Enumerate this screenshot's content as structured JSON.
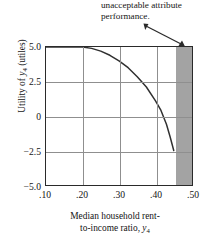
{
  "chart_data": {
    "type": "line",
    "title": "",
    "xlabel_line1": "Median household rent-",
    "xlabel_line2_pre": "to-income ratio, ",
    "xlabel_var": "y",
    "xlabel_sub": "4",
    "ylabel_pre": "Utility of ",
    "ylabel_var": "y",
    "ylabel_sub": "4",
    "ylabel_post": " (utiles)",
    "xlim": [
      0.1,
      0.5
    ],
    "ylim": [
      -5.0,
      5.0
    ],
    "xticks": [
      ".10",
      ".20",
      ".30",
      ".40",
      ".50"
    ],
    "xtick_values": [
      0.1,
      0.2,
      0.3,
      0.4,
      0.5
    ],
    "yticks": [
      "5.0",
      "2.5",
      "0",
      "-2.5",
      "-5.0"
    ],
    "ytick_values": [
      5.0,
      2.5,
      0,
      -2.5,
      -5.0
    ],
    "grid": true,
    "legend": "none",
    "x": [
      0.1,
      0.15,
      0.2,
      0.225,
      0.25,
      0.275,
      0.3,
      0.325,
      0.35,
      0.375,
      0.4,
      0.415,
      0.43,
      0.44,
      0.45
    ],
    "values": [
      5.0,
      5.0,
      5.0,
      4.9,
      4.7,
      4.4,
      4.0,
      3.5,
      2.85,
      2.1,
      1.1,
      0.4,
      -0.6,
      -1.5,
      -2.5
    ],
    "series": [
      {
        "name": "utility function",
        "values": [
          5.0,
          5.0,
          5.0,
          4.9,
          4.7,
          4.4,
          4.0,
          3.5,
          2.85,
          2.1,
          1.1,
          0.4,
          -0.6,
          -1.5,
          -2.5
        ]
      }
    ],
    "shaded_region": {
      "label": "unacceptable attribute performance",
      "x_start": 0.45,
      "x_end": 0.5,
      "color": "#a3a3a3"
    },
    "annotation": {
      "line1": "unacceptable attribute",
      "line2": "performance."
    },
    "colors": {
      "curve": "#303030",
      "frame": "#2a2a2a",
      "grid": "#8f8f8f",
      "shade": "#a3a3a3",
      "text": "#151515"
    }
  }
}
